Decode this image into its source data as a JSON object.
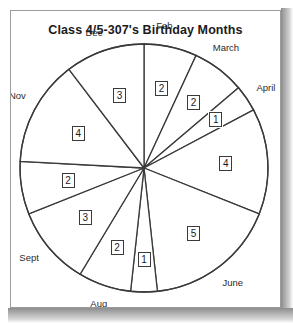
{
  "chart_data": {
    "type": "pie",
    "title": "Class 4/5-307's Birthday Months",
    "categories": [
      "Feb",
      "March",
      "April",
      "May",
      "June",
      "July",
      "Aug",
      "Sept",
      "Oct",
      "Nov",
      "Dec"
    ],
    "values": [
      2,
      2,
      1,
      4,
      5,
      1,
      2,
      3,
      2,
      4,
      3
    ],
    "total": 29,
    "unit": "students",
    "start_angle_deg": 0,
    "direction": "clockwise",
    "legend": "none",
    "grid": false,
    "data_labels": true,
    "slice_fill": "#ffffff",
    "slice_stroke": "#3a3a3a",
    "slices": [
      {
        "label": "Feb",
        "value": 2,
        "label_text": "2",
        "start_deg": 0.0,
        "end_deg": 24.83,
        "month_label_angle_deg": 8.0,
        "label_radius": 0.66
      },
      {
        "label": "March",
        "value": 2,
        "label_text": "2",
        "start_deg": 24.83,
        "end_deg": 49.66,
        "month_label_angle_deg": 33.0,
        "label_radius": 0.66
      },
      {
        "label": "April",
        "value": 1,
        "label_text": "1",
        "start_deg": 49.66,
        "end_deg": 62.07,
        "month_label_angle_deg": 56.0,
        "label_radius": 0.7
      },
      {
        "label": "May",
        "value": 4,
        "label_text": "4",
        "start_deg": 62.07,
        "end_deg": 111.72,
        "month_label_angle_deg": 87.0,
        "label_radius": 0.66
      },
      {
        "label": "June",
        "value": 5,
        "label_text": "5",
        "start_deg": 111.72,
        "end_deg": 173.79,
        "month_label_angle_deg": 143.0,
        "label_radius": 0.66
      },
      {
        "label": "July",
        "value": 1,
        "label_text": "1",
        "start_deg": 173.79,
        "end_deg": 186.21,
        "month_label_angle_deg": 180.0,
        "label_radius": 0.74
      },
      {
        "label": "Aug",
        "value": 2,
        "label_text": "2",
        "start_deg": 186.21,
        "end_deg": 211.03,
        "month_label_angle_deg": 198.0,
        "label_radius": 0.68
      },
      {
        "label": "Sept",
        "value": 3,
        "label_text": "3",
        "start_deg": 211.03,
        "end_deg": 248.28,
        "month_label_angle_deg": 231.0,
        "label_radius": 0.62
      },
      {
        "label": "Oct",
        "value": 2,
        "label_text": "2",
        "start_deg": 248.28,
        "end_deg": 273.1,
        "month_label_angle_deg": 265.0,
        "label_radius": 0.62
      },
      {
        "label": "Nov",
        "value": 4,
        "label_text": "4",
        "start_deg": 273.1,
        "end_deg": 322.76,
        "month_label_angle_deg": 300.0,
        "label_radius": 0.6
      },
      {
        "label": "Dec",
        "value": 3,
        "label_text": "3",
        "start_deg": 322.76,
        "end_deg": 360.0,
        "month_label_angle_deg": 340.0,
        "label_radius": 0.62
      }
    ]
  },
  "chart": {
    "title": "Class 4/5-307's Birthday Months"
  }
}
